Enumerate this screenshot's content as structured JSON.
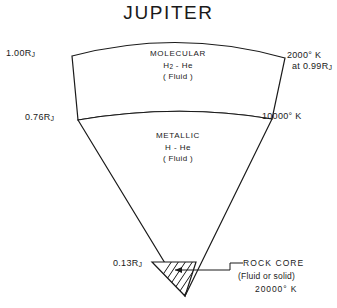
{
  "figure": {
    "title": "JUPITER",
    "background_color": "#ffffff",
    "line_color": "#1a1a1a"
  },
  "radius_labels": {
    "surface": {
      "value": "1.00",
      "unit": "R",
      "subscript": "J"
    },
    "molecular_metallic_boundary": {
      "value": "0.76",
      "unit": "R",
      "subscript": "J"
    },
    "core": {
      "value": "0.13",
      "unit": "R",
      "subscript": "J"
    }
  },
  "temperature_labels": {
    "outer": {
      "line1": "2000° K",
      "line2_prefix": "at  0.99",
      "line2_unit": "R",
      "line2_subscript": "J"
    },
    "metallic_boundary": "10000° K",
    "core": "20000° K"
  },
  "layers": [
    {
      "name": "molecular",
      "line1": "MOLECULAR",
      "composition_prefix": "H",
      "composition_subscript": "2",
      "composition_suffix": " - He",
      "state": "( Fluid )"
    },
    {
      "name": "metallic",
      "line1": "METALLIC",
      "composition_prefix": "H",
      "composition_subscript": "",
      "composition_suffix": " - He",
      "state": "( Fluid )"
    }
  ],
  "core": {
    "line1": "ROCK  CORE",
    "line2": "(Fluid or solid)",
    "line3": "20000° K"
  }
}
